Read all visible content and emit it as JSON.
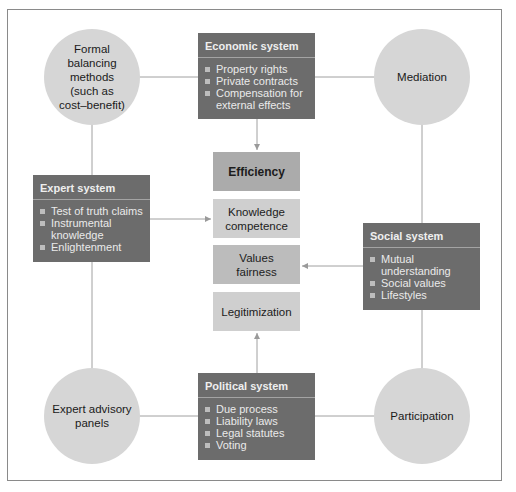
{
  "diagram": {
    "circles": {
      "top_left": {
        "label": "Formal\nbalancing\nmethods\n(such as\ncost–benefit)"
      },
      "top_right": {
        "label": "Mediation"
      },
      "bottom_left": {
        "label": "Expert advisory\npanels"
      },
      "bottom_right": {
        "label": "Participation"
      }
    },
    "systems": {
      "economic": {
        "title": "Economic system",
        "items": [
          "Property rights",
          "Private contracts",
          "Compensation for external effects"
        ]
      },
      "expert": {
        "title": "Expert system",
        "items": [
          "Test of truth claims",
          "Instrumental knowledge",
          "Enlightenment"
        ]
      },
      "social": {
        "title": "Social system",
        "items": [
          "Mutual understanding",
          "Social values",
          "Lifestyles"
        ]
      },
      "political": {
        "title": "Political system",
        "items": [
          "Due process",
          "Liability laws",
          "Legal statutes",
          "Voting"
        ]
      }
    },
    "values": [
      {
        "label": "Efficiency"
      },
      {
        "label": "Knowledge\ncompetence"
      },
      {
        "label": "Values\nfairness"
      },
      {
        "label": "Legitimization"
      }
    ],
    "colors": {
      "system_box": "#6c6c6c",
      "circle": "#d6d6d6",
      "efficiency_box": "#ababab",
      "knowledge_box": "#cfcfcf",
      "values_box": "#bcbcbc",
      "legitimization_box": "#cfcfcf",
      "connector": "#9a9a9a",
      "frame": "#8a8a8a"
    }
  }
}
